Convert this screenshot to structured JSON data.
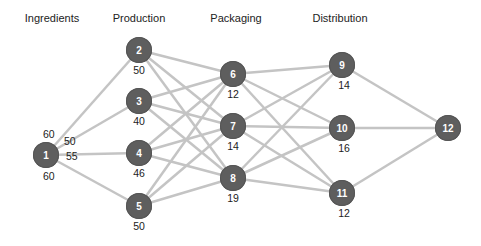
{
  "stages": [
    {
      "label": "Ingredients",
      "x": 52
    },
    {
      "label": "Production",
      "x": 139
    },
    {
      "label": "Packaging",
      "x": 236
    },
    {
      "label": "Distribution",
      "x": 340
    }
  ],
  "nodes": [
    {
      "id": "1",
      "x": 46,
      "y": 155,
      "capacity": "60"
    },
    {
      "id": "2",
      "x": 139,
      "y": 50,
      "capacity": "50"
    },
    {
      "id": "3",
      "x": 139,
      "y": 101,
      "capacity": "40"
    },
    {
      "id": "4",
      "x": 139,
      "y": 153,
      "capacity": "46"
    },
    {
      "id": "5",
      "x": 139,
      "y": 206,
      "capacity": "50"
    },
    {
      "id": "6",
      "x": 233,
      "y": 74,
      "capacity": "12"
    },
    {
      "id": "7",
      "x": 233,
      "y": 126,
      "capacity": "14"
    },
    {
      "id": "8",
      "x": 233,
      "y": 178,
      "capacity": "19"
    },
    {
      "id": "9",
      "x": 342,
      "y": 65,
      "capacity": "14"
    },
    {
      "id": "10",
      "x": 342,
      "y": 128,
      "capacity": "16"
    },
    {
      "id": "11",
      "x": 342,
      "y": 193,
      "capacity": "12"
    },
    {
      "id": "12",
      "x": 448,
      "y": 128,
      "capacity": ""
    }
  ],
  "edge_labels": [
    {
      "from": "1",
      "to": "2",
      "text": "60",
      "x": 43,
      "y": 128
    },
    {
      "from": "1",
      "to": "3",
      "text": "50",
      "x": 64,
      "y": 135
    },
    {
      "from": "1",
      "to": "4",
      "text": "55",
      "x": 66,
      "y": 150
    },
    {
      "from": "1",
      "to": "5",
      "text": "60",
      "x": 43,
      "y": 172
    }
  ],
  "edges": [
    [
      "1",
      "2"
    ],
    [
      "1",
      "3"
    ],
    [
      "1",
      "4"
    ],
    [
      "1",
      "5"
    ],
    [
      "2",
      "6"
    ],
    [
      "2",
      "7"
    ],
    [
      "2",
      "8"
    ],
    [
      "3",
      "6"
    ],
    [
      "3",
      "7"
    ],
    [
      "3",
      "8"
    ],
    [
      "4",
      "6"
    ],
    [
      "4",
      "7"
    ],
    [
      "4",
      "8"
    ],
    [
      "5",
      "6"
    ],
    [
      "5",
      "7"
    ],
    [
      "5",
      "8"
    ],
    [
      "6",
      "9"
    ],
    [
      "6",
      "10"
    ],
    [
      "6",
      "11"
    ],
    [
      "7",
      "9"
    ],
    [
      "7",
      "10"
    ],
    [
      "7",
      "11"
    ],
    [
      "8",
      "9"
    ],
    [
      "8",
      "10"
    ],
    [
      "8",
      "11"
    ],
    [
      "9",
      "12"
    ],
    [
      "10",
      "12"
    ],
    [
      "11",
      "12"
    ]
  ],
  "colors": {
    "node": "#5e5e5e",
    "edge": "#c4c4c4",
    "text": "#222222"
  }
}
